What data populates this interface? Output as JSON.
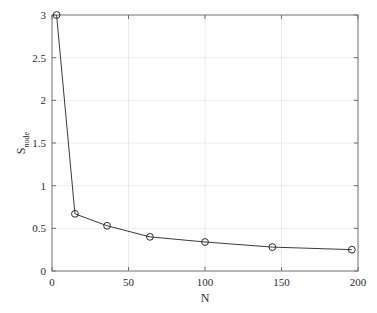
{
  "chart_data": {
    "type": "line",
    "title": "",
    "xlabel": "N",
    "ylabel": "S",
    "ylabel_subscript": "node",
    "ylabel_full": "S_node",
    "x": [
      3,
      15,
      36,
      64,
      100,
      144,
      196
    ],
    "y": [
      3.0,
      0.67,
      0.53,
      0.4,
      0.34,
      0.28,
      0.25
    ],
    "series": [
      {
        "name": "S_node",
        "x": [
          3,
          15,
          36,
          64,
          100,
          144,
          196
        ],
        "values": [
          3.0,
          0.67,
          0.53,
          0.4,
          0.34,
          0.28,
          0.25
        ],
        "marker": "circle-open",
        "line_color": "#3a3a3a",
        "marker_color": "#2b2b2b"
      }
    ],
    "xlim": [
      0,
      200
    ],
    "ylim": [
      0,
      3
    ],
    "xticks": [
      0,
      50,
      100,
      150,
      200
    ],
    "xtick_labels": [
      "0",
      "50",
      "100",
      "150",
      "200"
    ],
    "yticks": [
      0,
      0.5,
      1,
      1.5,
      2,
      2.5,
      3
    ],
    "ytick_labels": [
      "0",
      "0.5",
      "1",
      "1.5",
      "2",
      "2.5",
      "3"
    ],
    "grid": true,
    "grid_color": "#eceaea",
    "legend": null,
    "legend_position": "none",
    "axis_color": "#6e6e6e",
    "background": "#ffffff"
  }
}
